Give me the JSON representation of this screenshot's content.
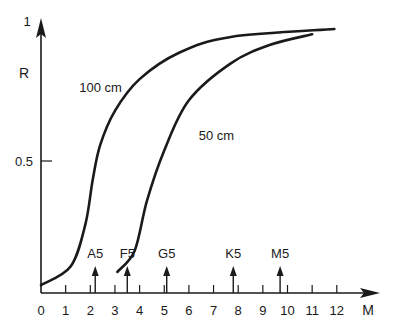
{
  "chart_data": {
    "type": "line",
    "title": "",
    "xlabel": "M",
    "ylabel": "R",
    "xlim": [
      0,
      12.8
    ],
    "ylim": [
      0,
      1
    ],
    "x_ticks": [
      0,
      1,
      2,
      3,
      4,
      5,
      6,
      7,
      8,
      9,
      10,
      11,
      12
    ],
    "y_ticks": [
      {
        "value": 0.5,
        "label": "0.5"
      },
      {
        "value": 1,
        "label": "1"
      }
    ],
    "grid": false,
    "series": [
      {
        "name": "100 cm",
        "label": "100 cm",
        "label_pos": {
          "x": 1.55,
          "y": 0.76
        },
        "points": [
          [
            0,
            0.03
          ],
          [
            1.2,
            0.1
          ],
          [
            1.8,
            0.26
          ],
          [
            2.1,
            0.43
          ],
          [
            2.4,
            0.56
          ],
          [
            3.0,
            0.69
          ],
          [
            4.0,
            0.81
          ],
          [
            5.6,
            0.91
          ],
          [
            7.7,
            0.97
          ],
          [
            11.9,
            1.0
          ]
        ]
      },
      {
        "name": "50 cm",
        "label": "50 cm",
        "label_pos": {
          "x": 6.4,
          "y": 0.58
        },
        "points": [
          [
            3.1,
            0.08
          ],
          [
            3.8,
            0.16
          ],
          [
            4.3,
            0.35
          ],
          [
            5.0,
            0.54
          ],
          [
            6.0,
            0.73
          ],
          [
            7.7,
            0.87
          ],
          [
            9.3,
            0.94
          ],
          [
            11.0,
            0.98
          ]
        ]
      }
    ],
    "annotations": [
      {
        "label": "A5",
        "x": 2.2
      },
      {
        "label": "F5",
        "x": 3.5
      },
      {
        "label": "G5",
        "x": 5.1
      },
      {
        "label": "K5",
        "x": 7.8
      },
      {
        "label": "M5",
        "x": 9.7
      }
    ]
  },
  "layout": {
    "origin_px": [
      41,
      293
    ],
    "px_per_x": 24.65,
    "px_per_y": 264,
    "line_color": "#1a1a1a"
  }
}
